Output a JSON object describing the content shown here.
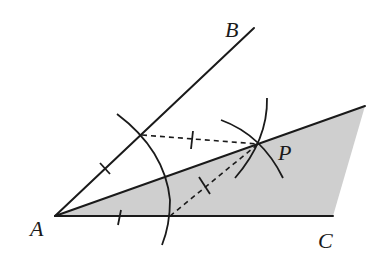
{
  "figure": {
    "type": "geometric-construction",
    "colors": {
      "line": "#1a1a1a",
      "shade": "#cfcfcf",
      "background": "#ffffff"
    }
  },
  "points": {
    "A": {
      "label": "A",
      "x": 55,
      "y": 216
    },
    "B": {
      "label": "B",
      "x": 254,
      "y": 28
    },
    "C": {
      "label": "C",
      "x": 333,
      "y": 216
    },
    "P": {
      "label": "P",
      "x": 258,
      "y": 144
    }
  },
  "labels": {
    "A": "A",
    "B": "B",
    "C": "C",
    "P": "P"
  },
  "elements": {
    "ray_AB": "A→B",
    "segment_AC": "A→C",
    "ray_AP": "A→P (bisector, extended)",
    "shaded_region": "A, ray AP end, C",
    "construction_arcs": 3,
    "dashed_segments": 2,
    "equal_length_ticks": 4
  }
}
